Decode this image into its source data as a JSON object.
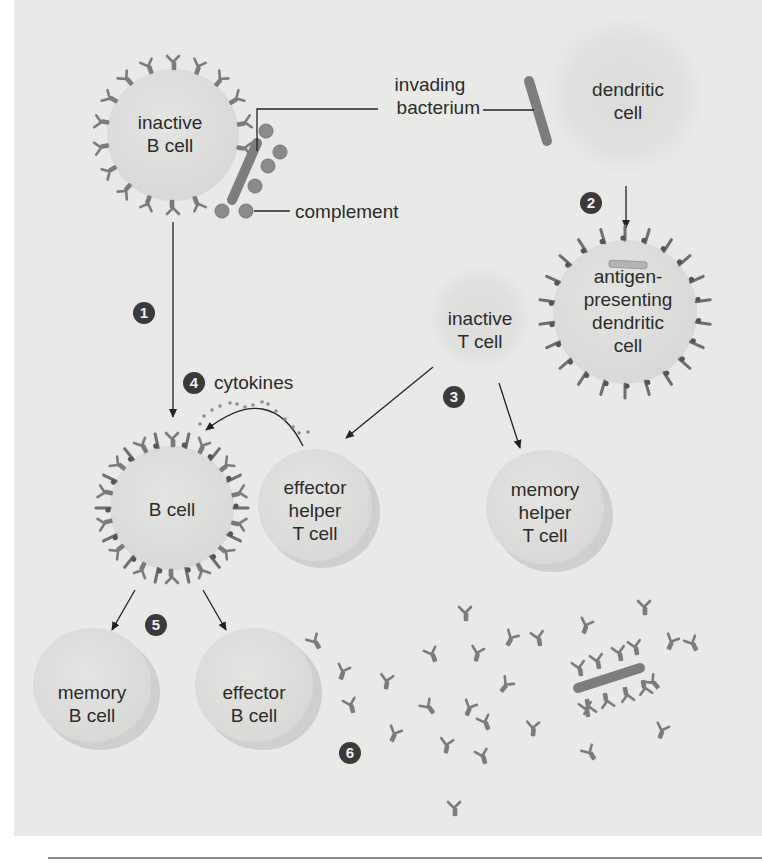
{
  "figure": {
    "kind": "immune response diagram",
    "colors": {
      "panel_bg": "#e9e9e7",
      "cell_fill": "#dededc",
      "antibody": "#7b7b7b",
      "bacterium": "#7d7d7d",
      "complement": "#8a8a8a",
      "step_badge": "#3a3a3a",
      "text": "#2b2b2b"
    },
    "labels": {
      "inactive_b_cell": [
        "inactive",
        "B cell"
      ],
      "invading_bacterium": [
        "invading",
        "bacterium"
      ],
      "dendritic_cell": [
        "dendritic",
        "cell"
      ],
      "complement": "complement",
      "antigen_presenting_dendritic_cell": [
        "antigen-",
        "presenting",
        "dendritic",
        "cell"
      ],
      "inactive_t_cell": [
        "inactive",
        "T cell"
      ],
      "cytokines": "cytokines",
      "b_cell": "B cell",
      "effector_helper_t_cell": [
        "effector",
        "helper",
        "T cell"
      ],
      "memory_helper_t_cell": [
        "memory",
        "helper",
        "T cell"
      ],
      "memory_b_cell": [
        "memory",
        "B cell"
      ],
      "effector_b_cell": [
        "effector",
        "B cell"
      ]
    },
    "steps": [
      "1",
      "2",
      "3",
      "4",
      "5",
      "6"
    ]
  }
}
